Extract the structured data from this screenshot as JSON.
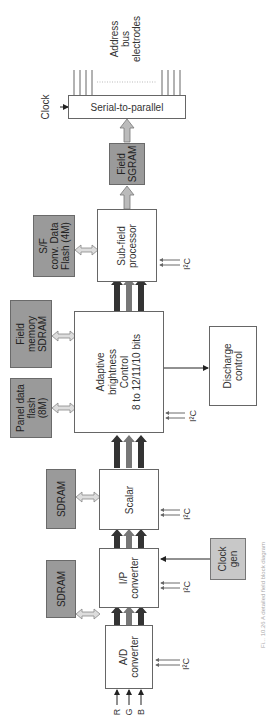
{
  "diagram": {
    "orientation": "rotated-90-ccw",
    "blocks": {
      "ad_converter": "A/D\nconverter",
      "ip_converter": "I/P\nconverter",
      "scalar": "Scalar",
      "adaptive_brightness": "Adaptive\nbrightness\nControl\n8 to 12/11/10 bits",
      "subfield_processor": "Sub-field\nprocessor",
      "field_sgram": "Field\nSGRAM",
      "serial_to_parallel": "Serial-to-parallel",
      "discharge_control": "Discharge\ncontrol",
      "clock_gen": "Clock\ngen",
      "sdram_1": "SDRAM",
      "sdram_2": "SDRAM",
      "panel_data_flash": "Panel data\nflash\n(8M)",
      "field_memory_sdram": "Field\nmemory\nSDRAM",
      "sf_conv_flash": "S/F\nconv. Data\nFlash (4M)"
    },
    "inputs": [
      "R",
      "G",
      "B"
    ],
    "i2c_label": "I²C",
    "clock_label": "Clock",
    "output_label": "Address\nbus\nelectrodes",
    "caption": "Fi... 10.26 A detailed field block diagram"
  }
}
